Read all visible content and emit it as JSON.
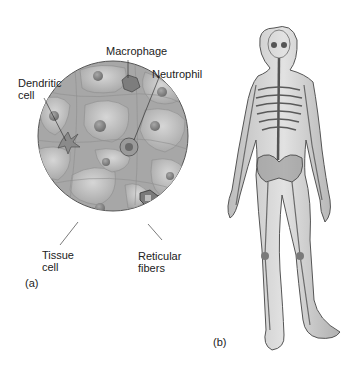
{
  "panel_a": {
    "tag": "(a)",
    "labels": {
      "macrophage": "Macrophage",
      "neutrophil": "Neutrophil",
      "dendritic_cell": "Dendritic\ncell",
      "tissue_cell": "Tissue\ncell",
      "reticular_fibers": "Reticular\nfibers"
    }
  },
  "panel_b": {
    "tag": "(b)"
  },
  "colors": {
    "background": "#ffffff",
    "circle_fill": "#b8b8b8",
    "cell_fill": "#c8c8c8",
    "nucleus": "#8a8a8a",
    "body_fill": "#d4d4d4",
    "skeleton": "#5a5a5a",
    "outline": "#555555"
  }
}
